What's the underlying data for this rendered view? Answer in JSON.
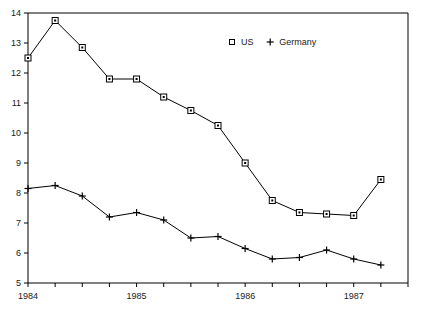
{
  "chart_data": {
    "type": "line",
    "title": "",
    "subtitle": "",
    "xlabel": "",
    "ylabel": "",
    "grid": false,
    "legend_position": "top-center",
    "xlim": [
      0,
      14
    ],
    "ylim": [
      5,
      14
    ],
    "y_ticks": [
      5,
      6,
      7,
      8,
      9,
      10,
      11,
      12,
      13,
      14
    ],
    "y_tick_labels": [
      "5",
      "6",
      "7",
      "8",
      "9",
      "10",
      "11",
      "12",
      "13",
      "14"
    ],
    "x_tick_labels": [
      "1984",
      "1985",
      "1986",
      "1987"
    ],
    "x_tick_label_positions": [
      0,
      4,
      8,
      12
    ],
    "x_minor_tick_count": 15,
    "x": [
      0,
      1,
      2,
      3,
      4,
      5,
      6,
      7,
      8,
      9,
      10,
      11,
      12,
      13
    ],
    "series": [
      {
        "name": "US",
        "marker": "open-square",
        "values": [
          12.5,
          13.75,
          12.85,
          11.8,
          11.8,
          11.2,
          10.75,
          10.25,
          9.0,
          7.75,
          7.35,
          7.3,
          7.25,
          8.45
        ]
      },
      {
        "name": "Germany",
        "marker": "plus",
        "values": [
          8.15,
          8.25,
          7.9,
          7.2,
          7.35,
          7.1,
          6.5,
          6.55,
          6.15,
          5.8,
          5.85,
          6.1,
          5.8,
          5.6
        ]
      }
    ],
    "legend": [
      {
        "label": "US",
        "marker": "open-square"
      },
      {
        "label": "Germany",
        "marker": "plus"
      }
    ],
    "colors": {
      "line": "#000000",
      "axis": "#000000",
      "text": "#1a1a1a",
      "background": "#ffffff"
    }
  }
}
